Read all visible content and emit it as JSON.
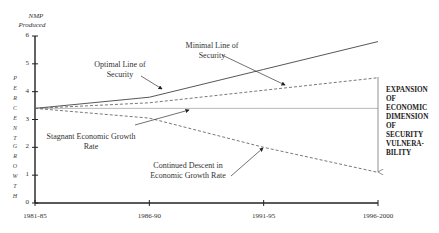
{
  "chart_data": {
    "type": "line",
    "title": "",
    "ylabel_top": "NMP Produced",
    "ylabel_side_1": "PERCENT",
    "ylabel_side_2": "GROWTH",
    "xlabel": "",
    "categories": [
      "1981-85",
      "1986-90",
      "1991-95",
      "1996-2000"
    ],
    "ylim": [
      0,
      6
    ],
    "yticks": [
      "6",
      "5",
      "4",
      "3",
      "2",
      "1",
      "0"
    ],
    "series": [
      {
        "name": "Optimal Line of Security",
        "style": "solid",
        "values": [
          3.4,
          3.8,
          4.8,
          5.8
        ]
      },
      {
        "name": "Minimal Line of Security",
        "style": "dashed",
        "values": [
          3.4,
          3.6,
          4.05,
          4.5
        ]
      },
      {
        "name": "Stagnant Economic Growth Rate",
        "style": "solid-light",
        "values": [
          3.4,
          3.4,
          3.4,
          3.4
        ]
      },
      {
        "name": "Continued Descent in Economic Growth Rate",
        "style": "dashed",
        "values": [
          3.4,
          3.05,
          2.0,
          1.1
        ]
      }
    ],
    "annotations": [
      {
        "text": "Optimal Line of Security",
        "points_to": "Optimal Line of Security"
      },
      {
        "text": "Minimal Line of Security",
        "points_to": "Minimal Line of Security"
      },
      {
        "text": "Stagnant Economic Growth Rate",
        "points_to": "Stagnant Economic Growth Rate"
      },
      {
        "text": "Continued Descent in Economic Growth Rate",
        "points_to": "Continued Descent in Economic Growth Rate"
      },
      {
        "text": "EXPANSION OF ECONOMIC DIMENSION OF SECURITY VULNERA-BILITY",
        "type": "vertical-arrow",
        "at": "1996-2000",
        "from": 4.5,
        "to": 1.1
      }
    ],
    "grid": false,
    "legend": "none"
  },
  "labels": {
    "nmp": "NMP",
    "produced": "Produced",
    "percent_letters": [
      "P",
      "E",
      "R",
      "C",
      "E",
      "N",
      "T"
    ],
    "growth_letters": [
      "G",
      "R",
      "O",
      "W",
      "T",
      "H"
    ],
    "optimal_1": "Optimal Line of",
    "optimal_2": "Security",
    "minimal_1": "Minimal Line of",
    "minimal_2": "Security",
    "stagnant_1": "Stagnant Economic Growth",
    "stagnant_2": "Rate",
    "descent_1": "Continued Descent in",
    "descent_2": "Economic Growth Rate",
    "side": [
      "EXPANSION",
      "OF",
      "ECONOMIC",
      "DIMENSION",
      "OF",
      "SECURITY",
      "VULNERA-",
      "BILITY"
    ]
  }
}
